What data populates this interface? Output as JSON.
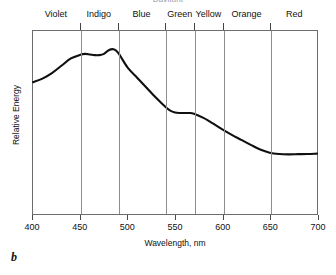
{
  "figure": {
    "panel_label": "b",
    "title": "Daylight"
  },
  "axes": {
    "x_title": "Wavelength, nm",
    "y_title": "Relative Energy",
    "x_ticks": [
      "400",
      "450",
      "500",
      "550",
      "600",
      "650",
      "700"
    ]
  },
  "bands": [
    {
      "label": "Violet",
      "start": 400,
      "end": 450
    },
    {
      "label": "Indigo",
      "start": 450,
      "end": 490
    },
    {
      "label": "Blue",
      "start": 490,
      "end": 540
    },
    {
      "label": "Green",
      "start": 540,
      "end": 570
    },
    {
      "label": "Yellow",
      "start": 570,
      "end": 600
    },
    {
      "label": "Orange",
      "start": 600,
      "end": 650
    },
    {
      "label": "Red",
      "start": 650,
      "end": 700
    }
  ],
  "colors": {
    "curve": "#101010",
    "frame": "#6d6d6d",
    "divider": "#8d8d8d",
    "text": "#111111"
  },
  "chart_data": {
    "type": "line",
    "title": "Daylight",
    "xlabel": "Wavelength, nm",
    "ylabel": "Relative Energy",
    "xlim": [
      400,
      700
    ],
    "ylim": [
      0,
      1
    ],
    "grid": false,
    "legend": null,
    "x_tick_values": [
      400,
      450,
      500,
      550,
      600,
      650,
      700
    ],
    "y_tick_values": [],
    "series": [
      {
        "name": "Relative Energy",
        "x": [
          400,
          410,
          420,
          430,
          440,
          450,
          455,
          460,
          465,
          470,
          475,
          480,
          485,
          490,
          500,
          510,
          520,
          530,
          540,
          545,
          550,
          555,
          560,
          565,
          570,
          580,
          590,
          600,
          610,
          620,
          630,
          640,
          650,
          660,
          670,
          680,
          690,
          700
        ],
        "values": [
          0.72,
          0.74,
          0.77,
          0.81,
          0.85,
          0.87,
          0.875,
          0.872,
          0.868,
          0.868,
          0.875,
          0.895,
          0.9,
          0.88,
          0.8,
          0.745,
          0.69,
          0.635,
          0.585,
          0.565,
          0.555,
          0.552,
          0.552,
          0.552,
          0.548,
          0.525,
          0.495,
          0.462,
          0.432,
          0.405,
          0.378,
          0.352,
          0.335,
          0.328,
          0.326,
          0.327,
          0.328,
          0.33
        ]
      }
    ],
    "band_boundaries_nm": [
      450,
      490,
      540,
      570,
      600,
      650
    ],
    "band_labels": [
      "Violet",
      "Indigo",
      "Blue",
      "Green",
      "Yellow",
      "Orange",
      "Red"
    ]
  }
}
